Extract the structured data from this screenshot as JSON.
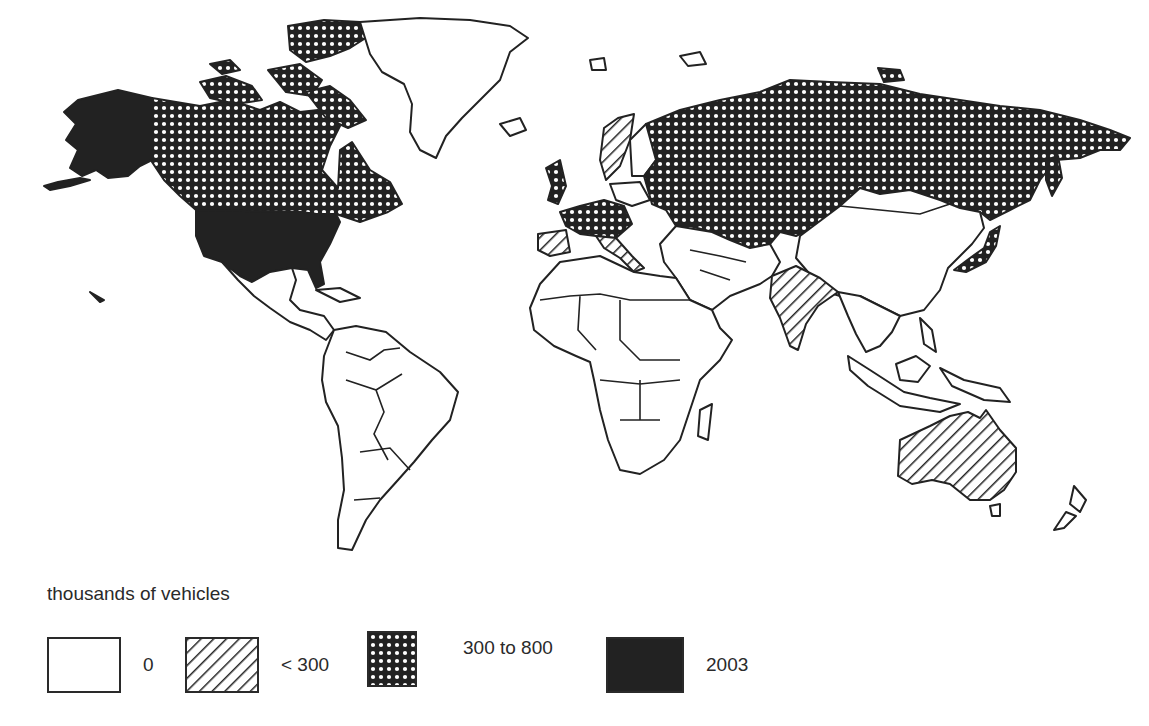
{
  "map": {
    "type": "choropleth",
    "projection": "world",
    "palette": {
      "none": "#ffffff",
      "low": "hatch",
      "mid": "crosshatch",
      "high": "#222222",
      "outline": "#222222"
    },
    "regions": [
      {
        "name": "United States (incl. Alaska)",
        "class": "high"
      },
      {
        "name": "Canada",
        "class": "mid"
      },
      {
        "name": "Greenland",
        "class": "none"
      },
      {
        "name": "Mexico & Central America",
        "class": "none"
      },
      {
        "name": "South America",
        "class": "none"
      },
      {
        "name": "Africa",
        "class": "none"
      },
      {
        "name": "USSR / Russia",
        "class": "mid"
      },
      {
        "name": "Western Europe (UK, France, Germany)",
        "class": "mid"
      },
      {
        "name": "Sweden",
        "class": "low"
      },
      {
        "name": "Spain",
        "class": "low"
      },
      {
        "name": "Italy",
        "class": "low"
      },
      {
        "name": "Japan",
        "class": "mid"
      },
      {
        "name": "India",
        "class": "low"
      },
      {
        "name": "Australia",
        "class": "low"
      },
      {
        "name": "China",
        "class": "none"
      },
      {
        "name": "Middle East",
        "class": "none"
      },
      {
        "name": "Southeast Asia",
        "class": "none"
      }
    ]
  },
  "legend": {
    "title": "thousands of vehicles",
    "items": [
      {
        "label": "0",
        "pattern": "empty"
      },
      {
        "label": "< 300",
        "pattern": "diagonal-hatch"
      },
      {
        "label": "300 to 800",
        "pattern": "crosshatch"
      },
      {
        "label": "2003",
        "pattern": "solid"
      }
    ]
  }
}
